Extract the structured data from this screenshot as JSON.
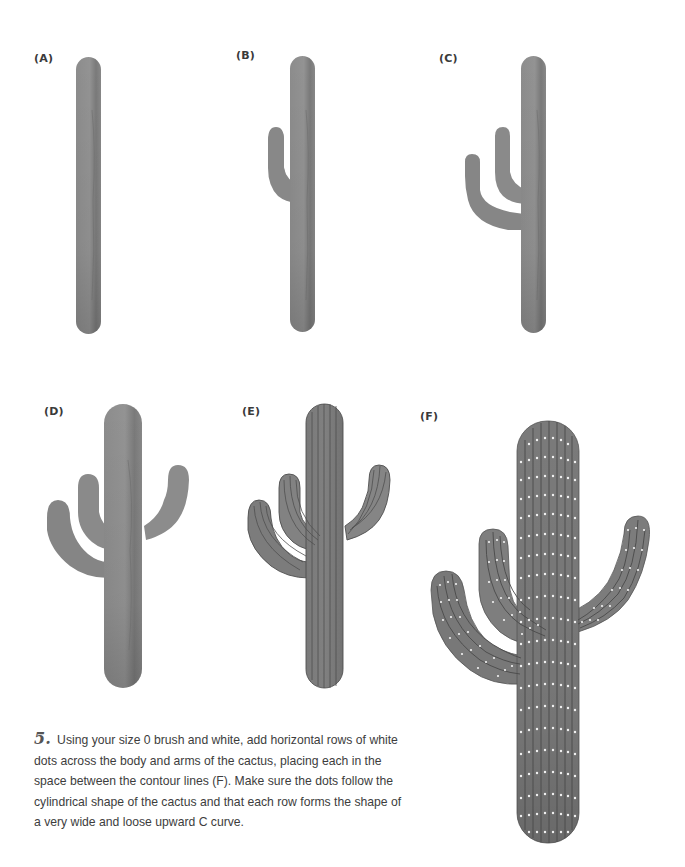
{
  "panels": [
    {
      "id": "A",
      "label": "(A)",
      "description": "cactus trunk only"
    },
    {
      "id": "B",
      "label": "(B)",
      "description": "trunk with one left arm"
    },
    {
      "id": "C",
      "label": "(C)",
      "description": "trunk with two left arms"
    },
    {
      "id": "D",
      "label": "(D)",
      "description": "trunk with two left arms and one right arm"
    },
    {
      "id": "E",
      "label": "(E)",
      "description": "cactus with vertical contour lines"
    },
    {
      "id": "F",
      "label": "(F)",
      "description": "cactus with contour lines and white dots"
    }
  ],
  "instructions": {
    "step_number": "5.",
    "text": "Using your size 0 brush and white, add horizontal rows of white dots across the body and arms of the cactus, placing each in the space between the contour lines (F). Make sure the dots follow the cylindrical shape of the cactus and that each row forms the shape of a very wide and loose upward C curve."
  },
  "colors": {
    "cactus_fill": "#8a8a8a",
    "cactus_dark": "#6e6e6e",
    "contour_line": "#4a4a4a",
    "dot": "#f2f2f2",
    "background": "#ffffff"
  }
}
